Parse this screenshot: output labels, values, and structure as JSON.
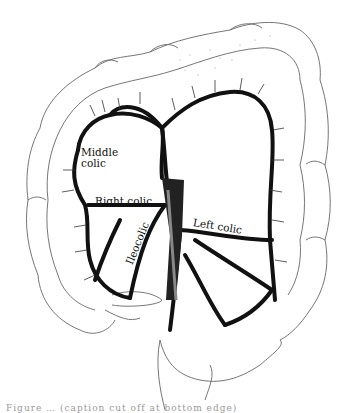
{
  "figure": {
    "labels": {
      "middle_colic": "Middle colic",
      "right_colic": "Right colic",
      "ileocolic": "Ileocolic",
      "left_colic": "Left colic"
    },
    "caption_visible": "Figure … (caption cut off at bottom edge)",
    "colors": {
      "vessel": "#111111",
      "outline": "#555555",
      "background": "#ffffff"
    }
  }
}
